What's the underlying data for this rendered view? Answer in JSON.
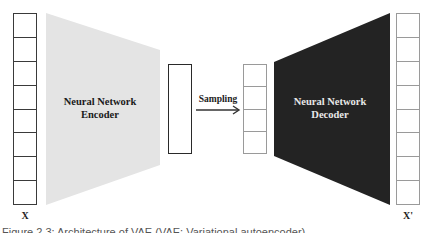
{
  "diagram": {
    "type": "variational-autoencoder-architecture",
    "input_vector": {
      "label": "X",
      "cells": 8
    },
    "encoder": {
      "line1": "Neural Network",
      "line2": "Encoder",
      "fill": "#e4e4e4",
      "text_color": "#1a1a1a"
    },
    "latent_vector": {
      "cells": 1
    },
    "sampling": {
      "label": "Sampling",
      "arrow": "right"
    },
    "sampled_vector": {
      "cells": 4
    },
    "decoder": {
      "line1": "Neural Network",
      "line2": "Decoder",
      "fill": "#232323",
      "text_color": "#e8e8e8"
    },
    "output_vector": {
      "label": "X'",
      "cells": 8
    }
  },
  "caption": "Figure 2.3: Architecture of VAE (VAE: Variational autoencoder)"
}
